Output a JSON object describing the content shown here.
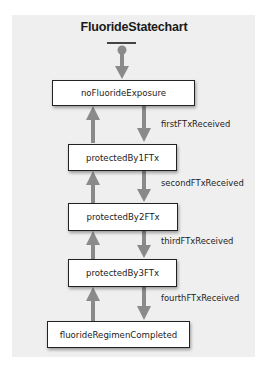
{
  "diagram": {
    "title": "FluorideStatechart",
    "colors": {
      "background": "#efefef",
      "arrow": "#8a8a8a",
      "state_fill": "#ffffff",
      "state_border": "#222222",
      "text": "#222222"
    },
    "initial_state": {
      "icon": "initial-state-dot-icon",
      "target": "noFluorideExposure"
    },
    "states": [
      {
        "id": "noFluorideExposure",
        "label": "noFluorideExposure"
      },
      {
        "id": "protectedBy1FTx",
        "label": "protectedBy1FTx"
      },
      {
        "id": "protectedBy2FTx",
        "label": "protectedBy2FTx"
      },
      {
        "id": "protectedBy3FTx",
        "label": "protectedBy3FTx"
      },
      {
        "id": "fluorideRegimenCompleted",
        "label": "fluorideRegimenCompleted"
      }
    ],
    "transitions": [
      {
        "from": "noFluorideExposure",
        "to": "protectedBy1FTx",
        "label": "firstFTxReceived"
      },
      {
        "from": "protectedBy1FTx",
        "to": "protectedBy2FTx",
        "label": "secondFTxReceived"
      },
      {
        "from": "protectedBy2FTx",
        "to": "protectedBy3FTx",
        "label": "thirdFTxReceived"
      },
      {
        "from": "protectedBy3FTx",
        "to": "fluorideRegimenCompleted",
        "label": "fourthFTxReceived"
      },
      {
        "from": "protectedBy1FTx",
        "to": "noFluorideExposure",
        "label": ""
      },
      {
        "from": "protectedBy2FTx",
        "to": "protectedBy1FTx",
        "label": ""
      },
      {
        "from": "protectedBy3FTx",
        "to": "protectedBy2FTx",
        "label": ""
      },
      {
        "from": "fluorideRegimenCompleted",
        "to": "protectedBy3FTx",
        "label": ""
      }
    ]
  }
}
